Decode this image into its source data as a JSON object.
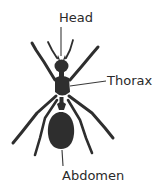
{
  "diagram": {
    "labels": {
      "head": "Head",
      "thorax": "Thorax",
      "abdomen": "Abdomen"
    },
    "colors": {
      "body": "#2e2e2e",
      "leader_line": "#3a3a3a",
      "label_text": "#2a2a2a",
      "background": "#ffffff"
    }
  }
}
